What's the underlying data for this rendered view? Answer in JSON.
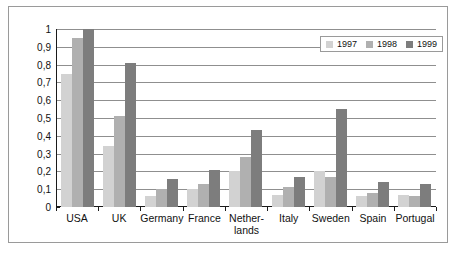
{
  "chart_data": {
    "type": "bar",
    "title": "",
    "xlabel": "",
    "ylabel": "",
    "ylim": [
      0,
      1
    ],
    "ytick_labels": [
      "1",
      "0,9",
      "0,8",
      "0,7",
      "0,6",
      "0,5",
      "0,4",
      "0,3",
      "0,2",
      "0,1",
      "0"
    ],
    "ytick_values": [
      1,
      0.9,
      0.8,
      0.7,
      0.6,
      0.5,
      0.4,
      0.3,
      0.2,
      0.1,
      0
    ],
    "grid": "horizontal",
    "legend_position": "top-right",
    "categories": [
      "USA",
      "UK",
      "Germany",
      "France",
      "Nether-\nlands",
      "Italy",
      "Sweden",
      "Spain",
      "Portugal"
    ],
    "series": [
      {
        "name": "1997",
        "color": "#d2d2d2",
        "values": [
          0.75,
          0.34,
          0.06,
          0.1,
          0.2,
          0.07,
          0.2,
          0.06,
          0.07
        ]
      },
      {
        "name": "1998",
        "color": "#b0b0b0",
        "values": [
          0.95,
          0.51,
          0.1,
          0.13,
          0.28,
          0.11,
          0.17,
          0.08,
          0.06
        ]
      },
      {
        "name": "1999",
        "color": "#7d7d7d",
        "values": [
          1.0,
          0.81,
          0.16,
          0.21,
          0.43,
          0.17,
          0.55,
          0.14,
          0.13
        ]
      }
    ]
  },
  "legend": {
    "items": [
      {
        "label": "1997"
      },
      {
        "label": "1998"
      },
      {
        "label": "1999"
      }
    ]
  }
}
